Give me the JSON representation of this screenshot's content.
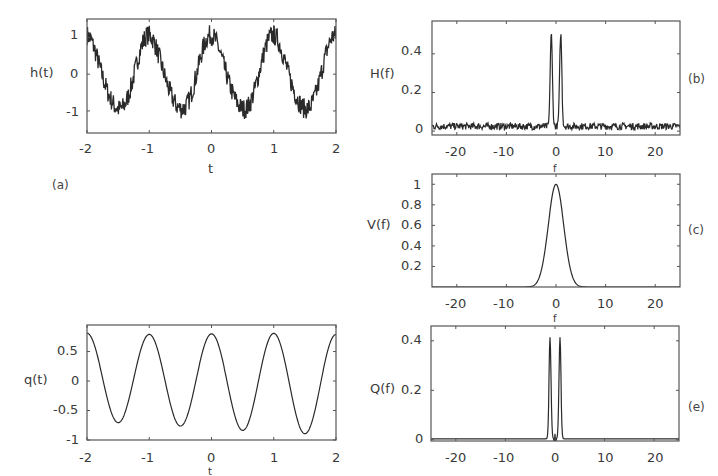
{
  "chart_data": [
    {
      "id": "a",
      "type": "line",
      "panel_label": "(a)",
      "title": "",
      "xlabel": "t",
      "ylabel": "h(t)",
      "xlim": [
        -2,
        2
      ],
      "ylim": [
        -1.6,
        1.5
      ],
      "xticks": [
        -2,
        -1,
        0,
        1,
        2
      ],
      "yticks": [
        -1,
        0,
        1
      ],
      "grid": false,
      "description": "noisy cosine, period 1",
      "x": [
        -2.0,
        -1.75,
        -1.5,
        -1.25,
        -1.0,
        -0.75,
        -0.5,
        -0.25,
        0.0,
        0.25,
        0.5,
        0.75,
        1.0,
        1.25,
        1.5,
        1.75,
        2.0
      ],
      "values": [
        1.3,
        0.1,
        -1.2,
        -0.2,
        1.1,
        0.1,
        -1.0,
        0.3,
        1.2,
        -0.1,
        -1.2,
        0.1,
        1.2,
        0.0,
        -1.3,
        -0.2,
        1.2
      ]
    },
    {
      "id": "b",
      "type": "line",
      "panel_label": "(b)",
      "title": "",
      "xlabel": "f",
      "ylabel": "H(f)",
      "xlim": [
        -25,
        25
      ],
      "ylim": [
        -0.02,
        0.57
      ],
      "xticks": [
        -20,
        -10,
        0,
        10,
        20
      ],
      "yticks": [
        0,
        0.2,
        0.4
      ],
      "grid": false,
      "description": "two spikes at f=±1 over noise floor ~0.02",
      "x": [
        -25,
        -20,
        -10,
        -2,
        -1,
        0,
        1,
        2,
        10,
        20,
        25
      ],
      "values": [
        0.01,
        0.02,
        0.01,
        0.02,
        0.5,
        0.02,
        0.5,
        0.02,
        0.01,
        0.02,
        0.01
      ]
    },
    {
      "id": "c",
      "type": "line",
      "panel_label": "(c)",
      "title": "",
      "xlabel": "f",
      "ylabel": "V(f)",
      "xlim": [
        -25,
        25
      ],
      "ylim": [
        0,
        1.1
      ],
      "xticks": [
        -20,
        -10,
        0,
        10,
        20
      ],
      "yticks": [
        0.2,
        0.4,
        0.6,
        0.8,
        1
      ],
      "grid": false,
      "description": "Gaussian centered at 0, peak 1",
      "x": [
        -5,
        -4,
        -3,
        -2,
        -1,
        0,
        1,
        2,
        3,
        4,
        5
      ],
      "values": [
        0.0,
        0.03,
        0.15,
        0.42,
        0.8,
        1.0,
        0.8,
        0.42,
        0.15,
        0.03,
        0.0
      ]
    },
    {
      "id": "d",
      "type": "line",
      "panel_label": "",
      "title": "",
      "xlabel": "t",
      "ylabel": "q(t)",
      "xlim": [
        -2,
        2
      ],
      "ylim": [
        -1,
        0.95
      ],
      "xticks": [
        -2,
        -1,
        0,
        1,
        2
      ],
      "yticks": [
        -1,
        -0.5,
        0,
        0.5
      ],
      "grid": false,
      "description": "smooth cosine, period 1",
      "x": [
        -2.0,
        -1.5,
        -1.0,
        -0.5,
        0.0,
        0.5,
        1.0,
        1.5,
        2.0
      ],
      "values": [
        0.78,
        -0.77,
        0.85,
        -0.82,
        0.85,
        -0.9,
        0.85,
        -0.93,
        0.75
      ]
    },
    {
      "id": "e",
      "type": "line",
      "panel_label": "(e)",
      "title": "",
      "xlabel": "f",
      "ylabel": "Q(f)",
      "xlim": [
        -25,
        25
      ],
      "ylim": [
        -0.005,
        0.46
      ],
      "xticks": [
        -20,
        -10,
        0,
        10,
        20
      ],
      "yticks": [
        0,
        0.2,
        0.4
      ],
      "grid": false,
      "description": "two sharp spikes at f=±1, flat elsewhere",
      "x": [
        -25,
        -2,
        -1,
        0,
        1,
        2,
        25
      ],
      "values": [
        0.005,
        0.005,
        0.42,
        0.02,
        0.42,
        0.005,
        0.005
      ]
    }
  ],
  "labels": {
    "a_ylabel": "h(t)",
    "a_xlabel": "t",
    "a_panel": "(a)",
    "b_ylabel": "H(f)",
    "b_xlabel": "f",
    "b_panel": "(b)",
    "c_ylabel": "V(f)",
    "c_xlabel": "f",
    "c_panel": "(c)",
    "d_ylabel": "q(t)",
    "d_xlabel": "t",
    "e_ylabel": "Q(f)",
    "e_xlabel": "f",
    "e_panel": "(e)"
  },
  "ticks": {
    "t": [
      "-2",
      "-1",
      "0",
      "1",
      "2"
    ],
    "f": [
      "-20",
      "-10",
      "0",
      "10",
      "20"
    ],
    "a_y": [
      "1",
      "0",
      "-1"
    ],
    "b_y": [
      "0.4",
      "0.2",
      "0"
    ],
    "c_y": [
      "1",
      "0.8",
      "0.6",
      "0.4",
      "0.2"
    ],
    "d_y": [
      "0.5",
      "0",
      "-0.5",
      "-1"
    ],
    "e_y": [
      "0.4",
      "0.2",
      "0"
    ]
  }
}
